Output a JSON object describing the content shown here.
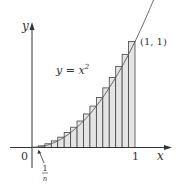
{
  "figure": {
    "curve_label": "y = x",
    "curve_label_exponent": "2",
    "point_label": "(1, 1)",
    "x_axis_label": "x",
    "y_axis_label": "y",
    "origin_label": "0",
    "x_tick_label": "1",
    "width_label_numerator": "1",
    "width_label_denominator": "n",
    "colors": {
      "rect_fill": "#e4e4e4",
      "rect_stroke": "#444444",
      "axis": "#333333",
      "curve": "#555555"
    }
  },
  "chart_data": {
    "type": "bar",
    "title": "",
    "function": "y = x^2",
    "n_rectangles": 16,
    "endpoint_rule": "right",
    "x": [
      0.0625,
      0.125,
      0.1875,
      0.25,
      0.3125,
      0.375,
      0.4375,
      0.5,
      0.5625,
      0.625,
      0.6875,
      0.75,
      0.8125,
      0.875,
      0.9375,
      1.0
    ],
    "values": [
      0.0039,
      0.0156,
      0.0352,
      0.0625,
      0.0977,
      0.1406,
      0.1914,
      0.25,
      0.3164,
      0.3906,
      0.4727,
      0.5625,
      0.6602,
      0.7656,
      0.8789,
      1.0
    ],
    "xlabel": "x",
    "ylabel": "y",
    "xlim": [
      0,
      1
    ],
    "ylim": [
      0,
      1
    ],
    "annotations": [
      "y = x^2",
      "(1, 1)",
      "1/n",
      "0",
      "1"
    ],
    "grid": false
  }
}
